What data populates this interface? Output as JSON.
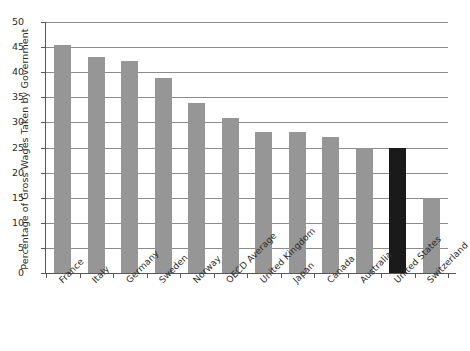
{
  "chart_data": {
    "type": "bar",
    "title": "",
    "xlabel": "",
    "ylabel": "Percentage of Gross Wages Taken by Government",
    "ylim": [
      0,
      50
    ],
    "ytick_step": 5,
    "yticks": [
      0,
      5,
      10,
      15,
      20,
      25,
      30,
      35,
      40,
      45,
      50
    ],
    "grid": true,
    "legend": "none",
    "categories": [
      "France",
      "Italy",
      "Germany",
      "Sweden",
      "Norway",
      "OECD Average",
      "United Kingdom",
      "Japan",
      "Canada",
      "Australia",
      "United States",
      "Switzerland"
    ],
    "values": [
      45.5,
      43.0,
      42.3,
      38.8,
      33.8,
      30.8,
      28.0,
      28.0,
      27.0,
      25.0,
      25.0,
      15.0
    ],
    "highlight_category": "United States",
    "colors": {
      "bar": "#969696",
      "bar_highlight": "#1a1a1a",
      "gridline": "#8c8c8c",
      "axis": "#575757",
      "text": "#2b2b2b",
      "background": "#ffffff"
    }
  }
}
